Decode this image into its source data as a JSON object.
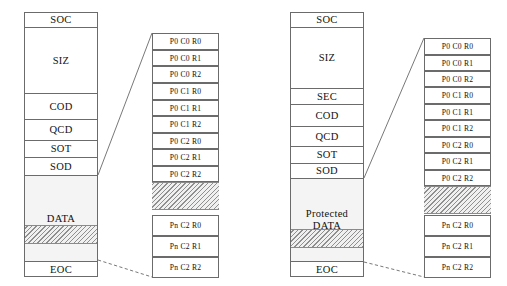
{
  "diagrams": [
    {
      "id": "plain-codestream",
      "codestream": {
        "name": "codestream-box",
        "segments": [
          {
            "label": "SOC",
            "kind": "marker"
          },
          {
            "label": "SIZ",
            "kind": "marker"
          },
          {
            "label": "COD",
            "kind": "marker"
          },
          {
            "label": "QCD",
            "kind": "marker"
          },
          {
            "label": "SOT",
            "kind": "marker"
          },
          {
            "label": "SOD",
            "kind": "marker"
          },
          {
            "label": "DATA",
            "kind": "data"
          },
          {
            "label": "EOC",
            "kind": "marker"
          }
        ]
      },
      "detail": {
        "name": "packet-detail-column",
        "packets_top": [
          "P0 C0 R0",
          "P0 C0 R1",
          "P0 C0 R2",
          "P0 C1 R0",
          "P0 C1 R1",
          "P0 C1 R2",
          "P0 C2 R0",
          "P0 C2 R1",
          "P0 C2 R2"
        ],
        "packets_bottom": [
          "Pn C2 R0",
          "Pn C2 R1",
          "Pn C2 R2"
        ]
      }
    },
    {
      "id": "protected-codestream",
      "codestream": {
        "name": "codestream-box",
        "segments": [
          {
            "label": "SOC",
            "kind": "marker"
          },
          {
            "label": "SIZ",
            "kind": "marker"
          },
          {
            "label": "SEC",
            "kind": "marker"
          },
          {
            "label": "COD",
            "kind": "marker"
          },
          {
            "label": "QCD",
            "kind": "marker"
          },
          {
            "label": "SOT",
            "kind": "marker"
          },
          {
            "label": "SOD",
            "kind": "marker"
          },
          {
            "label": "Protected DATA",
            "label_line1": "Protected",
            "label_line2": "DATA",
            "kind": "data"
          },
          {
            "label": "EOC",
            "kind": "marker"
          }
        ]
      },
      "detail": {
        "name": "packet-detail-column",
        "packets_top": [
          "P0 C0 R0",
          "P0 C0 R1",
          "P0 C0 R2",
          "P0 C1 R0",
          "P0 C1 R1",
          "P0 C1 R2",
          "P0 C2 R0",
          "P0 C2 R1",
          "P0 C2 R2"
        ],
        "packets_bottom": [
          "Pn C2 R0",
          "Pn C2 R1",
          "Pn C2 R2"
        ]
      }
    }
  ],
  "colors": {
    "stroke": "#6b6b6b",
    "text": "#111111",
    "data_fill": "#f4f4f4",
    "hatch": "#8f8f8f",
    "background": "#ffffff"
  }
}
